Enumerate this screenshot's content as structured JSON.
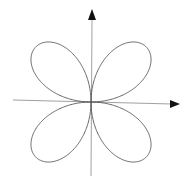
{
  "diagram": {
    "type": "polar-rose-curve",
    "petals": 4,
    "axes": {
      "x_arrow": true,
      "y_arrow": true
    },
    "colors": {
      "curve": "#555555",
      "axis": "#888888",
      "arrow": "#111111",
      "background": "#ffffff"
    }
  }
}
